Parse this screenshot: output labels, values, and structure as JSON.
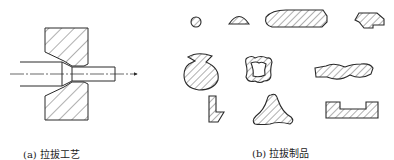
{
  "figure": {
    "panel_a": {
      "caption": "(a) 拉拔工艺",
      "subject": "drawing-die-cross-section",
      "elements": [
        "die-upper-half",
        "die-lower-half",
        "input-rod",
        "drawn-rod",
        "centerline",
        "drawing-direction-arrow"
      ]
    },
    "panel_b": {
      "caption": "(b) 拉拔制品",
      "products": [
        "small-round-bar",
        "half-round-bar",
        "flat-bar-chamfered",
        "stepped-bar",
        "notched-round-bar",
        "square-tube-wavy",
        "twisted-flat-bar",
        "L-shaped-profile",
        "tri-lobed-profile",
        "channel-profile"
      ]
    },
    "colors": {
      "stroke": "#2a2a2a",
      "hatch": "#3a3a3a",
      "background": "#ffffff"
    }
  }
}
